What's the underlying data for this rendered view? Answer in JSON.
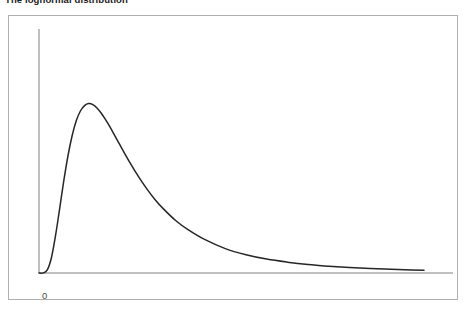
{
  "title": {
    "text": "The lognormal distribution"
  },
  "axes": {
    "origin_label": "0",
    "x_axis_color": "#808080",
    "y_axis_color": "#808080"
  },
  "frame": {
    "border_color": "#b0b0b0",
    "background": "#ffffff"
  },
  "chart_data": {
    "type": "line",
    "title": "The lognormal distribution",
    "xlabel": "",
    "ylabel": "",
    "grid": false,
    "legend": null,
    "curve_color": "#262626",
    "curve_width": 1.5,
    "xlim": [
      0,
      10
    ],
    "ylim": [
      0,
      0.72
    ],
    "tick_labels": {
      "x": [
        "0"
      ],
      "y": []
    },
    "series": [
      {
        "name": "lognormal pdf",
        "x": [
          0.0,
          0.1,
          0.2,
          0.3,
          0.4,
          0.5,
          0.6,
          0.7,
          0.8,
          0.9,
          1.0,
          1.1,
          1.2,
          1.3,
          1.4,
          1.5,
          1.6,
          1.7,
          1.8,
          1.9,
          2.0,
          2.2,
          2.4,
          2.6,
          2.8,
          3.0,
          3.3,
          3.6,
          4.0,
          4.5,
          5.0,
          5.5,
          6.0,
          6.5,
          7.0,
          7.5,
          8.0,
          8.5,
          9.0,
          9.3
        ],
        "y": [
          0.0,
          0.0003,
          0.009,
          0.045,
          0.111,
          0.191,
          0.273,
          0.346,
          0.405,
          0.449,
          0.478,
          0.494,
          0.5,
          0.497,
          0.487,
          0.472,
          0.454,
          0.434,
          0.412,
          0.39,
          0.368,
          0.325,
          0.285,
          0.249,
          0.217,
          0.19,
          0.155,
          0.128,
          0.099,
          0.072,
          0.054,
          0.041,
          0.032,
          0.025,
          0.02,
          0.016,
          0.013,
          0.011,
          0.009,
          0.008
        ]
      }
    ]
  }
}
